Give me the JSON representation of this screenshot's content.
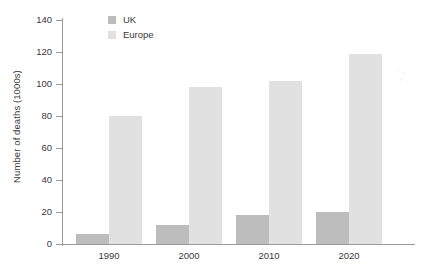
{
  "chart_data": {
    "type": "bar",
    "title": "",
    "xlabel": "",
    "ylabel": "Number of deaths (1000s)",
    "categories": [
      "1990",
      "2000",
      "2010",
      "2020"
    ],
    "series": [
      {
        "name": "UK",
        "color": "#bdbdbd",
        "values": [
          6,
          12,
          18,
          20
        ]
      },
      {
        "name": "Europe",
        "color": "#e1e1e1",
        "values": [
          80,
          98,
          102,
          119
        ]
      }
    ],
    "ylim": [
      0,
      140
    ],
    "ytick_step": 20,
    "ytick_labels": [
      "0",
      "20",
      "40",
      "60",
      "80",
      "100",
      "120",
      "140"
    ],
    "grid": false,
    "legend_position": "top-left-inside",
    "bar_grouping": "adjacent-pairs"
  },
  "legend": {
    "items": [
      {
        "label": "UK",
        "swatch": "uk"
      },
      {
        "label": "Europe",
        "swatch": "eu"
      }
    ]
  },
  "axes": {
    "y_title": "Number of deaths (1000s)",
    "y_ticks": [
      "140",
      "120",
      "100",
      "80",
      "60",
      "40",
      "20",
      "0"
    ],
    "x_ticks": [
      "1990",
      "2000",
      "2010",
      "2020"
    ]
  }
}
